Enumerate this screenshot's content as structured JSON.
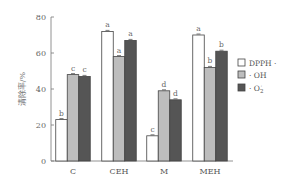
{
  "chart_data": {
    "type": "bar",
    "title": "",
    "xlabel": "",
    "ylabel": "清除率/%",
    "ylim": [
      0,
      80
    ],
    "yticks": [
      0,
      20,
      40,
      60,
      80
    ],
    "grid": false,
    "legend_position": "right",
    "categories": [
      "C",
      "CEH",
      "M",
      "MEH"
    ],
    "series": [
      {
        "name": "DPPH·",
        "color": "#ffffff",
        "values": [
          23,
          72,
          14,
          70
        ],
        "labels": [
          "b",
          "a",
          "c",
          "a"
        ]
      },
      {
        "name": "·OH",
        "color": "#bdbdbd",
        "values": [
          48,
          58,
          39,
          52
        ],
        "labels": [
          "c",
          "a",
          "d",
          "b"
        ]
      },
      {
        "name": "·O2",
        "color": "#555555",
        "values": [
          47,
          67,
          34,
          61
        ],
        "labels": [
          "c",
          "a",
          "d",
          "b"
        ]
      }
    ]
  },
  "legend": [
    {
      "label": "DPPH ·"
    },
    {
      "label": "· OH"
    },
    {
      "label": "· O"
    }
  ]
}
